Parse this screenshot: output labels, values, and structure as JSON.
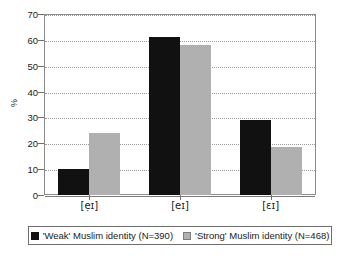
{
  "chart_data": {
    "type": "bar",
    "title": "",
    "subtitle": "",
    "xlabel": "",
    "ylabel": "%",
    "categories": [
      "[ẹɪ]",
      "[eɪ]",
      "[ɛɪ]"
    ],
    "series": [
      {
        "name": "'Weak' Muslim identity (N=390)",
        "color": "#111111",
        "values": [
          10,
          61,
          29
        ]
      },
      {
        "name": "'Strong' Muslim identity (N=468)",
        "color": "#b0b0b0",
        "values": [
          24,
          58,
          18.5
        ]
      }
    ],
    "ylim": [
      0,
      70
    ],
    "ytick_labels": [
      "0",
      "10",
      "20",
      "30",
      "40",
      "50",
      "60",
      "70"
    ],
    "ytick_values": [
      0,
      10,
      20,
      30,
      40,
      50,
      60,
      70
    ],
    "grid": true,
    "grid_style": "dotted",
    "legend_position": "bottom",
    "legend_boxed": true,
    "background_color": "#ffffff",
    "frame_color": "#8c8c8c"
  }
}
